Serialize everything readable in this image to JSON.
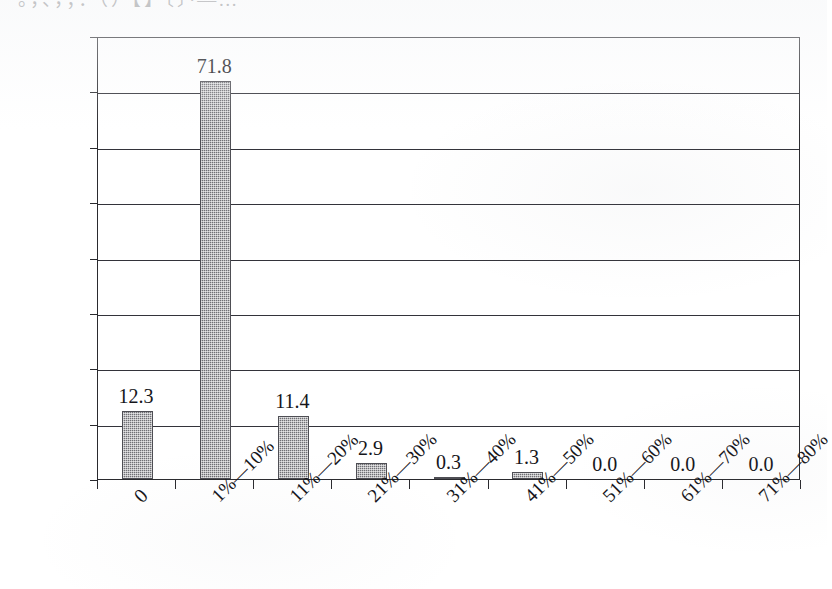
{
  "figure": {
    "background_color": "#ffffff",
    "ink_color": "#1a1a1a",
    "bar_fill_color": "#6f6f74",
    "bar_edge_color": "#4e4e54",
    "top_clipped_text": "。，、，；：（）【】〔〕·—…"
  },
  "chart_data": {
    "type": "bar",
    "title": "",
    "subtitle": "",
    "xlabel": "",
    "ylabel": "",
    "categories": [
      "0",
      "1%—10%",
      "11%—20%",
      "21%—30%",
      "31%—40%",
      "41%—50%",
      "51%—60%",
      "61%—70%",
      "71%—80%"
    ],
    "values": [
      12.3,
      71.8,
      11.4,
      2.9,
      0.3,
      1.3,
      0.0,
      0.0,
      0.0
    ],
    "data_labels": [
      "12.3",
      "71.8",
      "11.4",
      "2.9",
      "0.3",
      "1.3",
      "0.0",
      "0.0",
      "0.0"
    ],
    "ylim": [
      0,
      80
    ],
    "ytick_values": [
      0,
      10,
      20,
      30,
      40,
      50,
      60,
      70,
      80
    ],
    "ytick_labels": [
      "0.0%",
      "10.0%",
      "20.0%",
      "30.0%",
      "40.0%",
      "50.0%",
      "60.0%",
      "70.0%",
      "80.0%"
    ],
    "grid": true,
    "grid_axis": "y",
    "legend": false,
    "legend_position": "none",
    "series": [
      {
        "name": "",
        "values": [
          12.3,
          71.8,
          11.4,
          2.9,
          0.3,
          1.3,
          0.0,
          0.0,
          0.0
        ]
      }
    ],
    "xtick_rotation_degrees": -45,
    "value_unit": "%"
  }
}
